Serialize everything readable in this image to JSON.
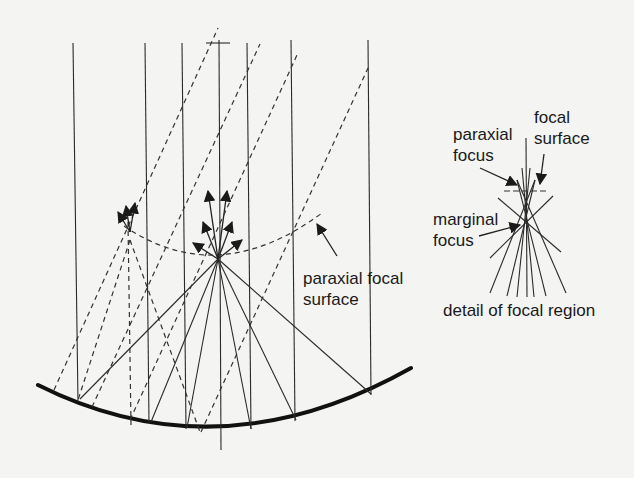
{
  "figure": {
    "type": "optics-ray-diagram",
    "colors": {
      "background": "#f4f4f2",
      "line": "#222222"
    }
  },
  "labels": {
    "paraxial_focal_surface_line1": "paraxial focal",
    "paraxial_focal_surface_line2": "surface",
    "paraxial_focus_line1": "paraxial",
    "paraxial_focus_line2": "focus",
    "focal_surface_line1": "focal",
    "focal_surface_line2": "surface",
    "marginal_focus_line1": "marginal",
    "marginal_focus_line2": "focus",
    "detail_caption": "detail of focal region"
  },
  "main_diagram": {
    "incident_rays_x": [
      73,
      145,
      182,
      219,
      247,
      291,
      368
    ],
    "focus_point": [
      218,
      259
    ],
    "mirror": {
      "left": [
        38,
        385
      ],
      "bottom": [
        219,
        432
      ],
      "right": [
        411,
        368
      ]
    }
  }
}
